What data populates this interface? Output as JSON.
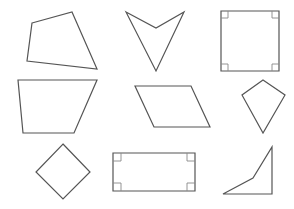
{
  "figure": {
    "width": 294,
    "height": 209,
    "background": "#ffffff",
    "stroke_color": "#555555",
    "marker_color": "#888888"
  },
  "shapes": [
    {
      "name": "irregular-quadrilateral",
      "points": "32,23 72,12 97,69 27,61",
      "right_angles": []
    },
    {
      "name": "concave-dart",
      "points": "126,12 156,28 184,12 156,71",
      "right_angles": []
    },
    {
      "name": "square",
      "points": "221,11 279,11 279,71 221,71",
      "right_angles": [
        "221,11",
        "279,11",
        "279,71",
        "221,71"
      ]
    },
    {
      "name": "trapezoid",
      "points": "18,80 97,80 74,133 23,133",
      "right_angles": []
    },
    {
      "name": "parallelogram",
      "points": "135,86 191,86 210,127 154,127",
      "right_angles": []
    },
    {
      "name": "kite",
      "points": "263,80 285,95 263,133 242,95",
      "right_angles": []
    },
    {
      "name": "rhombus-square-rotated",
      "points": "63,144 90,172 63,199 36,172",
      "right_angles": []
    },
    {
      "name": "rectangle",
      "points": "113,153 195,153 195,191 113,191",
      "right_angles": [
        "113,153",
        "195,153",
        "195,191",
        "113,191"
      ]
    },
    {
      "name": "concave-quadrilateral-right-angle",
      "points": "223,194 253,178 272,147 272,194",
      "right_angles": []
    }
  ],
  "right_angle_markers": {
    "square": [
      {
        "x": 221,
        "y": 11,
        "dx": 7,
        "dy": 7
      },
      {
        "x": 279,
        "y": 11,
        "dx": -7,
        "dy": 7
      },
      {
        "x": 279,
        "y": 71,
        "dx": -7,
        "dy": -7
      },
      {
        "x": 221,
        "y": 71,
        "dx": 7,
        "dy": -7
      }
    ],
    "rectangle": [
      {
        "x": 113,
        "y": 153,
        "dx": 8,
        "dy": 8
      },
      {
        "x": 195,
        "y": 153,
        "dx": -8,
        "dy": 8
      },
      {
        "x": 195,
        "y": 191,
        "dx": -8,
        "dy": -8
      },
      {
        "x": 113,
        "y": 191,
        "dx": 8,
        "dy": -8
      }
    ]
  }
}
